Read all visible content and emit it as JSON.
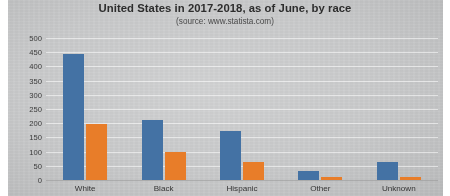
{
  "chart_data": {
    "type": "bar",
    "title": "United States in 2017-2018, as of June, by race",
    "subtitle": "(source: www.statista.com)",
    "xlabel": "",
    "ylabel": "",
    "categories": [
      "White",
      "Black",
      "Hispanic",
      "Other",
      "Unknown"
    ],
    "series": [
      {
        "name": "series-1",
        "color": "#4472a4",
        "values": [
          445,
          210,
          172,
          30,
          65
        ]
      },
      {
        "name": "series-2",
        "color": "#e87d29",
        "values": [
          197,
          97,
          62,
          10,
          10
        ]
      }
    ],
    "ylim": [
      0,
      500
    ],
    "ytick_step": 50,
    "yticks": [
      500,
      450,
      400,
      350,
      300,
      250,
      200,
      150,
      100,
      50,
      0
    ],
    "ytick_labels": [
      "500",
      "450",
      "400",
      "350",
      "300",
      "250",
      "200",
      "150",
      "100",
      "50",
      "0"
    ],
    "grid": "horizontal",
    "legend": "none",
    "plot_background": "#c9cacb"
  }
}
